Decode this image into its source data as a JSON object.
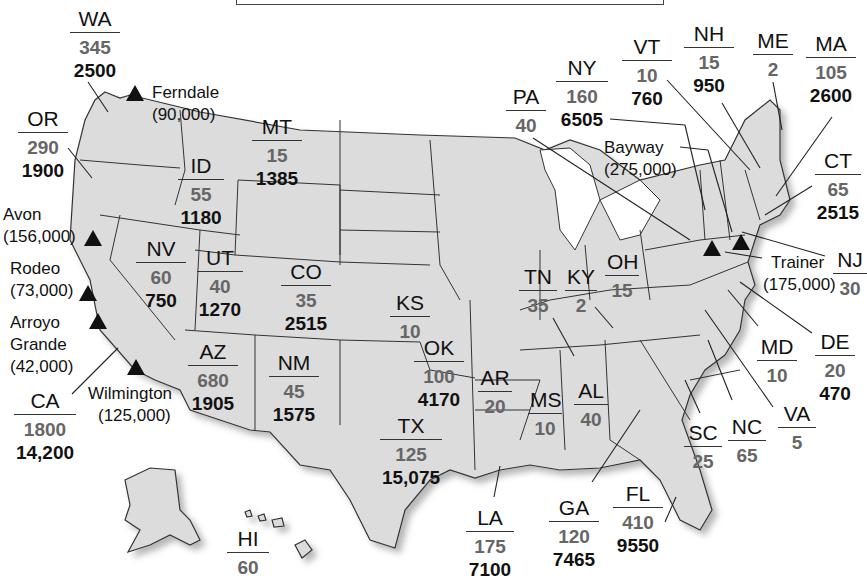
{
  "colors": {
    "land": "#dcdcdc",
    "border": "#333333",
    "value1": "#666666",
    "value2": "#111111"
  },
  "states": [
    {
      "abbr": "WA",
      "v1": "345",
      "v2": "2500"
    },
    {
      "abbr": "OR",
      "v1": "290",
      "v2": "1900"
    },
    {
      "abbr": "ID",
      "v1": "55",
      "v2": "1180"
    },
    {
      "abbr": "MT",
      "v1": "15",
      "v2": "1385"
    },
    {
      "abbr": "NV",
      "v1": "60",
      "v2": "750"
    },
    {
      "abbr": "UT",
      "v1": "40",
      "v2": "1270"
    },
    {
      "abbr": "CO",
      "v1": "35",
      "v2": "2515"
    },
    {
      "abbr": "AZ",
      "v1": "680",
      "v2": "1905"
    },
    {
      "abbr": "NM",
      "v1": "45",
      "v2": "1575"
    },
    {
      "abbr": "CA",
      "v1": "1800",
      "v2": "14,200"
    },
    {
      "abbr": "KS",
      "v1": "10",
      "v2": ""
    },
    {
      "abbr": "OK",
      "v1": "100",
      "v2": "4170"
    },
    {
      "abbr": "TX",
      "v1": "125",
      "v2": "15,075"
    },
    {
      "abbr": "AR",
      "v1": "20",
      "v2": ""
    },
    {
      "abbr": "LA",
      "v1": "175",
      "v2": "7100"
    },
    {
      "abbr": "MS",
      "v1": "10",
      "v2": ""
    },
    {
      "abbr": "AL",
      "v1": "40",
      "v2": ""
    },
    {
      "abbr": "TN",
      "v1": "35",
      "v2": ""
    },
    {
      "abbr": "KY",
      "v1": "2",
      "v2": ""
    },
    {
      "abbr": "OH",
      "v1": "15",
      "v2": ""
    },
    {
      "abbr": "GA",
      "v1": "120",
      "v2": "7465"
    },
    {
      "abbr": "FL",
      "v1": "410",
      "v2": "9550"
    },
    {
      "abbr": "SC",
      "v1": "25",
      "v2": ""
    },
    {
      "abbr": "NC",
      "v1": "65",
      "v2": ""
    },
    {
      "abbr": "VA",
      "v1": "5",
      "v2": ""
    },
    {
      "abbr": "MD",
      "v1": "10",
      "v2": ""
    },
    {
      "abbr": "DE",
      "v1": "20",
      "v2": "470"
    },
    {
      "abbr": "NJ",
      "v1": "30",
      "v2": ""
    },
    {
      "abbr": "CT",
      "v1": "65",
      "v2": "2515"
    },
    {
      "abbr": "MA",
      "v1": "105",
      "v2": "2600"
    },
    {
      "abbr": "ME",
      "v1": "2",
      "v2": ""
    },
    {
      "abbr": "NH",
      "v1": "15",
      "v2": "950"
    },
    {
      "abbr": "VT",
      "v1": "10",
      "v2": "760"
    },
    {
      "abbr": "NY",
      "v1": "160",
      "v2": "6505"
    },
    {
      "abbr": "PA",
      "v1": "40",
      "v2": ""
    },
    {
      "abbr": "HI",
      "v1": "60",
      "v2": ""
    }
  ],
  "refineries": [
    {
      "name": "Ferndale",
      "capacity": "(90,000)"
    },
    {
      "name": "Avon",
      "capacity": "(156,000)"
    },
    {
      "name": "Rodeo",
      "capacity": "(73,000)"
    },
    {
      "name": "Arroyo Grande",
      "name_line1": "Arroyo",
      "name_line2": "Grande",
      "capacity": "(42,000)"
    },
    {
      "name": "Wilmington",
      "capacity": "(125,000)"
    },
    {
      "name": "Bayway",
      "capacity": "(275,000)"
    },
    {
      "name": "Trainer",
      "capacity": "(175,000)"
    }
  ]
}
